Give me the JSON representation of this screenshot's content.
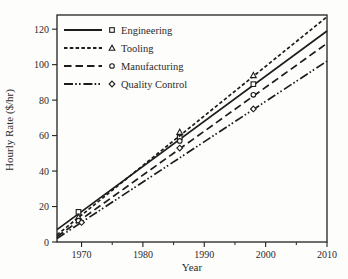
{
  "figure": {
    "background": "#fdfdfb",
    "ink": "#1c1c1c",
    "frame_color": "#222222"
  },
  "chart_data": {
    "type": "line",
    "title": "",
    "xlabel": "Year",
    "ylabel": "Hourly Rate ($/hr)",
    "xlim": [
      1966,
      2010
    ],
    "ylim": [
      0,
      128
    ],
    "x_major_ticks": [
      1970,
      1980,
      1990,
      2000,
      2010
    ],
    "x_minor_ticks": [
      1975,
      1985,
      1995,
      2005
    ],
    "y_major_ticks": [
      0,
      20,
      40,
      60,
      80,
      100,
      120
    ],
    "grid": false,
    "legend_position": "top-left",
    "series": [
      {
        "name": "Engineering",
        "marker": "square",
        "dash": "solid",
        "fit_line": {
          "x": [
            1966,
            2010
          ],
          "y": [
            7,
            119
          ]
        },
        "points": {
          "x": [
            1969.5,
            1986,
            1998
          ],
          "y": [
            17,
            59,
            89
          ]
        }
      },
      {
        "name": "Tooling",
        "marker": "triangle",
        "dash": "short-dash",
        "fit_line": {
          "x": [
            1966,
            2010
          ],
          "y": [
            4,
            127
          ]
        },
        "points": {
          "x": [
            1969.5,
            1986,
            1998
          ],
          "y": [
            14,
            62,
            94
          ]
        }
      },
      {
        "name": "Manufacturing",
        "marker": "circle",
        "dash": "long-dash",
        "fit_line": {
          "x": [
            1966,
            2010
          ],
          "y": [
            3,
            112
          ]
        },
        "points": {
          "x": [
            1969.5,
            1986,
            1998
          ],
          "y": [
            12,
            57,
            83
          ]
        }
      },
      {
        "name": "Quality Control",
        "marker": "diamond",
        "dash": "dash-dot-dot",
        "fit_line": {
          "x": [
            1966,
            2010
          ],
          "y": [
            2,
            102
          ]
        },
        "points": {
          "x": [
            1970,
            1986,
            1998
          ],
          "y": [
            11,
            53,
            75
          ]
        }
      }
    ]
  }
}
